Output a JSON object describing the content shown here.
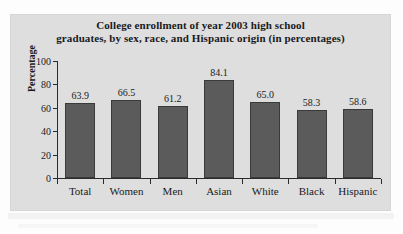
{
  "figure": {
    "title_line_1": "College enrollment of year 2003 high school",
    "title_line_2": "graduates, by sex, race, and Hispanic origin (in percentages)",
    "panel_color": "#dedede",
    "bar_color": "#5b5b5b",
    "bar_edge_color": "#3a3a3a",
    "axis_color": "#2b2b2b",
    "text_color": "#1a1a1a"
  },
  "chart_data": {
    "type": "bar",
    "title": "College enrollment of year 2003 high school graduates, by sex, race, and Hispanic origin (in percentages)",
    "xlabel": "",
    "ylabel": "Percentage",
    "categories": [
      "Total",
      "Women",
      "Men",
      "Asian",
      "White",
      "Black",
      "Hispanic"
    ],
    "values": [
      63.9,
      66.5,
      61.2,
      84.1,
      65.0,
      58.3,
      58.6
    ],
    "value_labels": [
      "63.9",
      "66.5",
      "61.2",
      "84.1",
      "65.0",
      "58.3",
      "58.6"
    ],
    "ylim": [
      0,
      100
    ],
    "yticks": [
      0,
      20,
      40,
      60,
      80,
      100
    ],
    "ytick_labels": [
      "0",
      "20",
      "40",
      "60",
      "80",
      "100"
    ],
    "grid": false,
    "legend": false,
    "legend_position": "none"
  }
}
